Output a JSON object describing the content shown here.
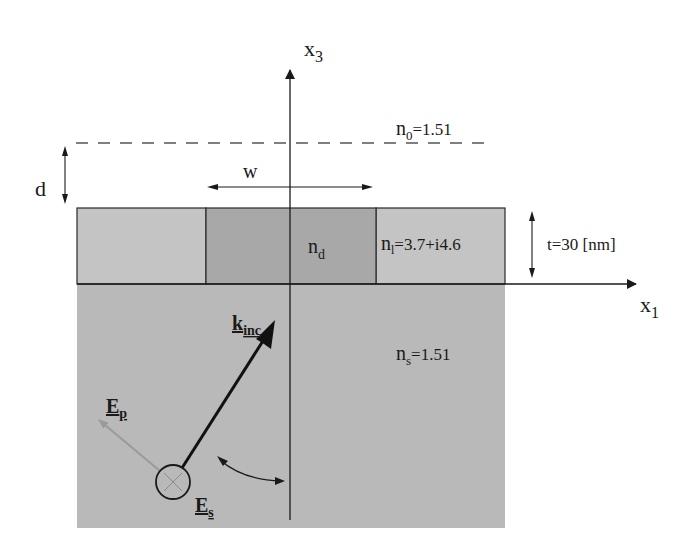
{
  "figure": {
    "type": "schematic"
  },
  "axes": {
    "vertical_label": "x",
    "vertical_sub": "3",
    "horizontal_label": "x",
    "horizontal_sub": "1"
  },
  "regions": {
    "superstrate": {
      "symbol": "n",
      "sub": "0",
      "value": "=1.51"
    },
    "slot": {
      "symbol": "n",
      "sub": "d"
    },
    "layer": {
      "symbol": "n",
      "sub": "l",
      "value": "=3.7+i4.6"
    },
    "substrate": {
      "symbol": "n",
      "sub": "s",
      "value": "=1.51"
    }
  },
  "dimensions": {
    "distance": "d",
    "width": "w",
    "thickness": "t=30 [nm]"
  },
  "vectors": {
    "wave_vector": {
      "symbol": "k",
      "sub": "inc"
    },
    "p_field": {
      "symbol": "E",
      "sub": "p"
    },
    "s_field": {
      "symbol": "E",
      "sub": "s"
    }
  },
  "colors": {
    "background": "#ffffff",
    "layer_light": "#c4c4c4",
    "slot_dark": "#a8a8a8",
    "substrate": "#b9b9b9",
    "line": "#1a1a1a",
    "ep_arrow": "#8e8e8e",
    "dashed": "#555555"
  }
}
